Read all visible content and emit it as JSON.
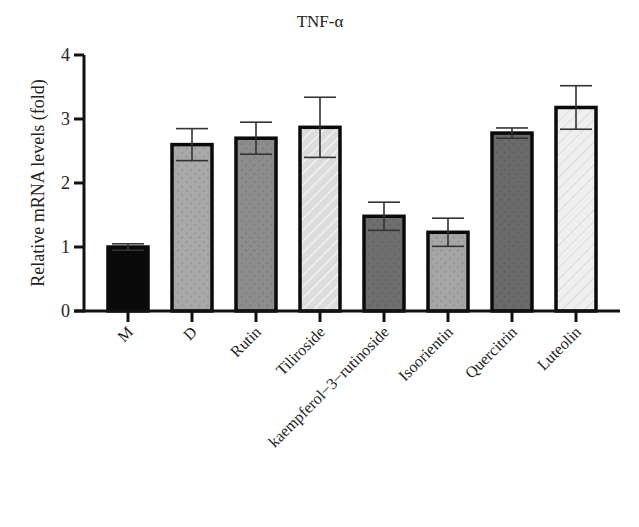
{
  "chart_data": {
    "type": "bar",
    "title": "TNF-α",
    "xlabel": "",
    "ylabel": "Relative mRNA levels (fold)",
    "ylim": [
      0,
      4
    ],
    "yticks": [
      0,
      1,
      2,
      3,
      4
    ],
    "grid": false,
    "legend": "none",
    "categories": [
      "M",
      "D",
      "Rutin",
      "Tiliroside",
      "kaempferol-3-rutinoside",
      "Isoorientin",
      "Quercitrin",
      "Luteolin"
    ],
    "values": [
      1.0,
      2.6,
      2.7,
      2.87,
      1.48,
      1.23,
      2.78,
      3.18
    ],
    "errors": [
      0.05,
      0.25,
      0.25,
      0.47,
      0.22,
      0.22,
      0.08,
      0.34
    ],
    "bar_styles": [
      {
        "fill": "#0a0a0a",
        "pattern": "solid"
      },
      {
        "fill": "#a9a9a9",
        "pattern": "speckle"
      },
      {
        "fill": "#8c8c8c",
        "pattern": "speckle"
      },
      {
        "fill": "#dcdcdc",
        "pattern": "hatch"
      },
      {
        "fill": "#6e6e6e",
        "pattern": "speckle"
      },
      {
        "fill": "#a6a6a6",
        "pattern": "speckle"
      },
      {
        "fill": "#6a6a6a",
        "pattern": "speckle"
      },
      {
        "fill": "#eeeeee",
        "pattern": "hatch"
      }
    ]
  }
}
